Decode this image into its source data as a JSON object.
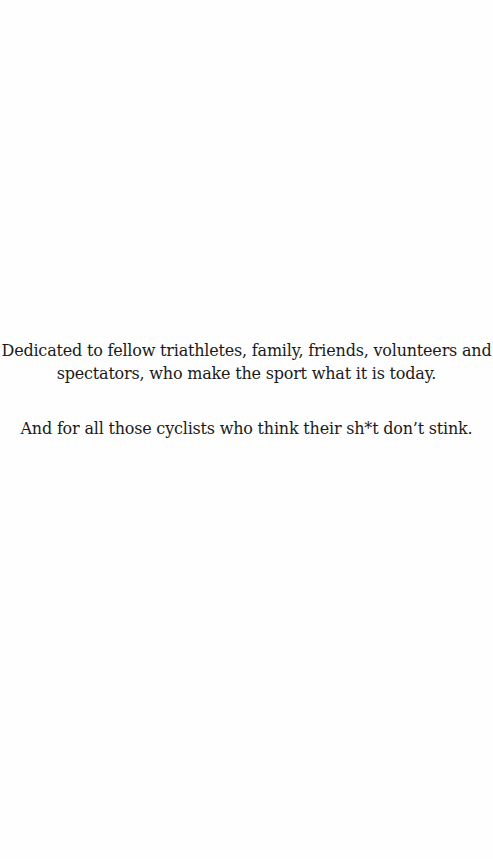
{
  "page": {
    "background": "#fefefe",
    "text_color": "#1a1a1a"
  },
  "dedication": {
    "paragraph_1": {
      "lines": [
        "Dedicated to fellow triathletes, family, friends, volunteers and",
        "spectators, who make the sport what it is today."
      ]
    },
    "paragraph_2": {
      "lines": [
        "And for all those cyclists who think their sh*t don’t stink."
      ]
    }
  }
}
